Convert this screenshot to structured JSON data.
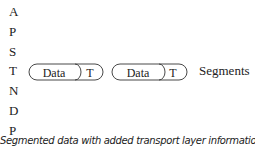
{
  "layers": [
    {
      "letter": "A"
    },
    {
      "letter": "P"
    },
    {
      "letter": "S"
    },
    {
      "letter": "T"
    },
    {
      "letter": "N"
    },
    {
      "letter": "D"
    },
    {
      "letter": "P"
    }
  ],
  "segments": [
    {
      "data_label": "Data",
      "header_label": "T"
    },
    {
      "data_label": "Data",
      "header_label": "T"
    }
  ],
  "segments_label": "Segments",
  "caption": "Segmented data with added transport layer information"
}
